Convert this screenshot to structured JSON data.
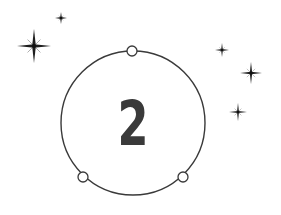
{
  "badge": {
    "number": "2",
    "colors": {
      "stroke": "#3a3a3a",
      "numeral": "#3a3a3a",
      "background": "#ffffff"
    },
    "ring": {
      "cx": 133,
      "cy": 123,
      "r": 72
    },
    "nodes": [
      {
        "name": "top",
        "cx": 132,
        "cy": 51,
        "r": 5
      },
      {
        "name": "bottom-left",
        "cx": 83,
        "cy": 177,
        "r": 5
      },
      {
        "name": "bottom-right",
        "cx": 183,
        "cy": 177,
        "r": 5
      }
    ]
  },
  "sparkles": [
    {
      "name": "large-left",
      "cx": 34,
      "cy": 46,
      "arm": 17
    },
    {
      "name": "small-top-left",
      "cx": 61,
      "cy": 18,
      "arm": 6
    },
    {
      "name": "small-right-top",
      "cx": 222,
      "cy": 50,
      "arm": 7
    },
    {
      "name": "medium-right",
      "cx": 251,
      "cy": 73,
      "arm": 11
    },
    {
      "name": "small-right-bottom",
      "cx": 238,
      "cy": 112,
      "arm": 9
    }
  ]
}
